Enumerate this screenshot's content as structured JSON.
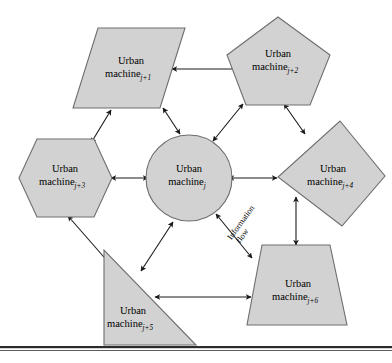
{
  "figure": {
    "flow_label": {
      "line1": "Information",
      "line2": "flow"
    },
    "colors": {
      "shape_fill": "#d2d2d2",
      "shape_stroke": "#6e6e6e",
      "arrow_color": "#1a1a1a",
      "text_color": "#000000",
      "background": "#ffffff",
      "rule_color": "#2b2b2b"
    },
    "nodes": [
      {
        "id": "center",
        "shape": "circle",
        "name": "Urban",
        "name_line2": "machine",
        "subscript": "j"
      },
      {
        "id": "j1",
        "shape": "parallelogram",
        "name": "Urban",
        "name_line2": "machine",
        "subscript": "j+1"
      },
      {
        "id": "j2",
        "shape": "pentagon",
        "name": "Urban",
        "name_line2": "machine",
        "subscript": "j+2"
      },
      {
        "id": "j3",
        "shape": "hexagon",
        "name": "Urban",
        "name_line2": "machine",
        "subscript": "j+3"
      },
      {
        "id": "j4",
        "shape": "diamond",
        "name": "Urban",
        "name_line2": "machine",
        "subscript": "j+4"
      },
      {
        "id": "j5",
        "shape": "right-triangle",
        "name": "Urban",
        "name_line2": "machine",
        "subscript": "j+5"
      },
      {
        "id": "j6",
        "shape": "trapezoid",
        "name": "Urban",
        "name_line2": "machine",
        "subscript": "j+6"
      }
    ],
    "edges": [
      {
        "from": "j1",
        "to": "j2",
        "style": "double-headed"
      },
      {
        "from": "j1",
        "to": "j3",
        "style": "double-headed"
      },
      {
        "from": "j1",
        "to": "center",
        "style": "double-headed"
      },
      {
        "from": "j2",
        "to": "center",
        "style": "double-headed"
      },
      {
        "from": "j2",
        "to": "j4",
        "style": "double-headed"
      },
      {
        "from": "j3",
        "to": "center",
        "style": "double-headed"
      },
      {
        "from": "j3",
        "to": "j5",
        "style": "double-headed"
      },
      {
        "from": "j4",
        "to": "center",
        "style": "double-headed"
      },
      {
        "from": "j4",
        "to": "j6",
        "style": "double-headed"
      },
      {
        "from": "j5",
        "to": "center",
        "style": "double-headed"
      },
      {
        "from": "j5",
        "to": "j6",
        "style": "double-headed"
      },
      {
        "from": "j6",
        "to": "center",
        "style": "double-headed",
        "label": "Information flow"
      }
    ]
  }
}
